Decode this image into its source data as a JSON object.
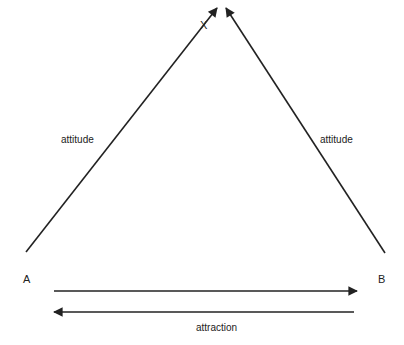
{
  "diagram": {
    "type": "triangle-relations",
    "nodes": {
      "x": {
        "label": "X"
      },
      "a": {
        "label": "A"
      },
      "b": {
        "label": "B"
      }
    },
    "edges": {
      "a_to_x": {
        "label": "attitude"
      },
      "b_to_x": {
        "label": "attitude"
      },
      "a_b": {
        "label": "attraction"
      }
    },
    "colors": {
      "line": "#222222",
      "background": "#ffffff"
    }
  }
}
